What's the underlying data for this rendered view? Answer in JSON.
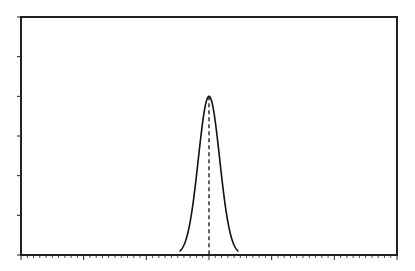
{
  "chart_data": {
    "type": "line",
    "title": "",
    "xlabel": "",
    "ylabel": "",
    "xlim": [
      -3,
      3
    ],
    "ylim": [
      0,
      6
    ],
    "grid": false,
    "legend": null,
    "x_major_ticks": [
      -3,
      -2,
      -1,
      0,
      1,
      2,
      3
    ],
    "x_minor_per_major": 10,
    "y_major_ticks": [
      0,
      1,
      2,
      3,
      4,
      5,
      6
    ],
    "tick_labels_shown": false,
    "series": [
      {
        "name": "gaussian-peak",
        "kind": "gaussian",
        "center": 0.0,
        "sigma": 0.17,
        "amplitude": 4.0,
        "x_range": [
          -0.47,
          0.47
        ],
        "color": "#111111"
      }
    ],
    "annotations": [
      {
        "type": "vertical-dashed-line",
        "x": 0.0,
        "y_from": 0,
        "y_to": 4.0,
        "color": "#222222"
      }
    ]
  },
  "style": {
    "axis_color": "#222222",
    "curve_color": "#111111",
    "background": "#ffffff"
  }
}
